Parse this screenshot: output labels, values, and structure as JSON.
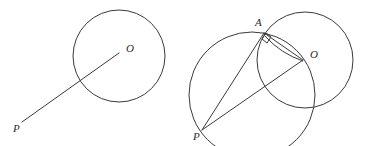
{
  "figure": {
    "type": "geometry-diagram",
    "background_color": "#ffffff",
    "stroke_color": "#3a3a3a",
    "label_color": "#2b2b2b",
    "stroke_width": 1,
    "canvas": {
      "width": 367,
      "height": 146
    }
  },
  "panels": [
    {
      "id": "panel-left",
      "name": "given-circle-and-external-point",
      "circles": [
        {
          "id": "left-main-circle",
          "name": "circle-O",
          "center": {
            "x": 119,
            "y": 56
          },
          "radius": 46
        }
      ],
      "segments": [
        {
          "id": "left-segment-PO",
          "name": "segment-PO",
          "from": {
            "x": 22,
            "y": 122
          },
          "to": {
            "x": 119,
            "y": 53
          }
        }
      ],
      "points": [
        {
          "id": "left-point-O",
          "label": "O",
          "x": 119,
          "y": 56,
          "label_x": 126,
          "label_y": 52
        },
        {
          "id": "left-point-P",
          "label": "P",
          "x": 22,
          "y": 122,
          "label_x": 13,
          "label_y": 132
        }
      ]
    },
    {
      "id": "panel-right",
      "name": "construction-with-tangent-point",
      "circles": [
        {
          "id": "right-main-circle",
          "name": "circle-O",
          "center": {
            "x": 305,
            "y": 60
          },
          "radius": 48
        },
        {
          "id": "right-diameter-circle",
          "name": "circle-on-diameter-PO",
          "center": {
            "x": 252,
            "y": 95
          },
          "radius": 63
        }
      ],
      "segments": [
        {
          "id": "right-segment-PA",
          "name": "segment-PA",
          "from": {
            "x": 202,
            "y": 130
          },
          "to": {
            "x": 264,
            "y": 33
          }
        },
        {
          "id": "right-segment-PO",
          "name": "segment-PO",
          "from": {
            "x": 202,
            "y": 130
          },
          "to": {
            "x": 303,
            "y": 60
          }
        },
        {
          "id": "right-segment-AO",
          "name": "segment-AO",
          "from": {
            "x": 264,
            "y": 33
          },
          "to": {
            "x": 303,
            "y": 60
          }
        }
      ],
      "arcs": [
        {
          "id": "right-arc-AO",
          "name": "arc-A-to-O",
          "from": {
            "x": 265,
            "y": 36
          },
          "to": {
            "x": 303,
            "y": 61
          },
          "bulge": "below"
        }
      ],
      "angle_markers": [
        {
          "id": "right-angle-at-A",
          "name": "right-angle-marker",
          "vertex": {
            "x": 264,
            "y": 34
          },
          "measure_degrees": 90
        }
      ],
      "points": [
        {
          "id": "right-point-A",
          "label": "A",
          "x": 264,
          "y": 33,
          "label_x": 255,
          "label_y": 26
        },
        {
          "id": "right-point-O",
          "label": "O",
          "x": 303,
          "y": 60,
          "label_x": 310,
          "label_y": 58
        },
        {
          "id": "right-point-P",
          "label": "P",
          "x": 202,
          "y": 130,
          "label_x": 193,
          "label_y": 140
        }
      ]
    }
  ]
}
